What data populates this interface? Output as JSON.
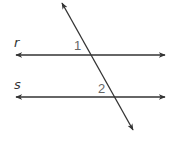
{
  "diagram": {
    "lines": [
      {
        "id": "r",
        "label": "r",
        "x1": 16,
        "y1": 55,
        "x2": 165,
        "y2": 55
      },
      {
        "id": "s",
        "label": "s",
        "x1": 16,
        "y1": 97,
        "x2": 165,
        "y2": 97
      },
      {
        "id": "transversal",
        "label": "",
        "x1": 62,
        "y1": 3,
        "x2": 133,
        "y2": 130
      }
    ],
    "angle_labels": [
      {
        "label": "1",
        "x": 74,
        "y": 50
      },
      {
        "label": "2",
        "x": 98,
        "y": 93
      }
    ],
    "line_labels": [
      {
        "label": "r",
        "x": 14,
        "y": 47
      },
      {
        "label": "s",
        "x": 14,
        "y": 89
      }
    ],
    "colors": {
      "stroke": "#333333",
      "angle_label": "#666666",
      "background": "#ffffff"
    }
  }
}
